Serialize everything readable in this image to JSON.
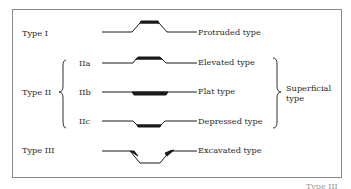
{
  "figure": {
    "rows": [
      {
        "group": "Type I",
        "sub": "",
        "name": "Protruded type",
        "shape": "protruded"
      },
      {
        "group": "Type II",
        "sub": "IIa",
        "name": "Elevated type",
        "shape": "elevated"
      },
      {
        "group": "Type II",
        "sub": "IIb",
        "name": "Flat type",
        "shape": "flat"
      },
      {
        "group": "Type II",
        "sub": "IIc",
        "name": "Depressed type",
        "shape": "depressed"
      },
      {
        "group": "Type III",
        "sub": "",
        "name": "Excavated type",
        "shape": "excavated"
      }
    ],
    "labels": {
      "type1": "Type I",
      "type2": "Type II",
      "type3": "Type III",
      "iia": "IIa",
      "iib": "IIb",
      "iic": "IIc",
      "protruded": "Protruded type",
      "elevated": "Elevated type",
      "flat": "Flat type",
      "depressed": "Depressed type",
      "excavated": "Excavated type",
      "superficial_line1": "Superficial",
      "superficial_line2": "type"
    },
    "footer_partial": "Type III",
    "colors": {
      "stroke": "#1a1a1a",
      "border": "#8a8a8a",
      "text": "#2a2a2a"
    }
  }
}
